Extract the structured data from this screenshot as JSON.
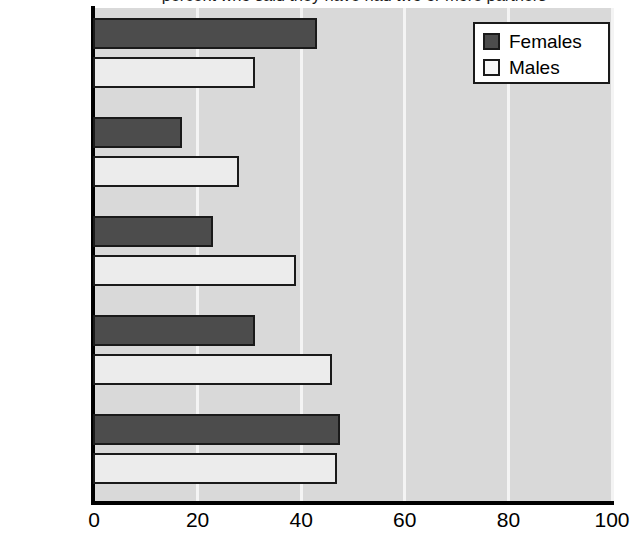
{
  "chart_data": {
    "type": "bar",
    "orientation": "horizontal",
    "title": "percent who said they have had two or more partners",
    "xlabel": "",
    "ylabel": "",
    "categories": [
      "Sweden",
      "France",
      "Canada",
      "Great\nBritain",
      "United\nStates"
    ],
    "series": [
      {
        "name": "Females",
        "values": [
          43,
          17,
          23,
          31,
          47.5
        ],
        "color": "#4c4c4c"
      },
      {
        "name": "Males",
        "values": [
          31,
          28,
          39,
          46,
          47
        ],
        "color": "#ececec"
      }
    ],
    "xlim": [
      0,
      100
    ],
    "xticks": [
      0,
      20,
      40,
      60,
      80,
      100
    ],
    "xtick_labels": [
      "0",
      "20",
      "40",
      "60",
      "80",
      "100"
    ],
    "grid": true,
    "grid_axis": "x",
    "legend_position": "top-right",
    "plot_background": "#d9d9d9",
    "gridline_color": "#f4f4f4",
    "axis_color": "#000000"
  },
  "legend": {
    "entries": [
      {
        "label": "Females"
      },
      {
        "label": "Males"
      }
    ]
  }
}
